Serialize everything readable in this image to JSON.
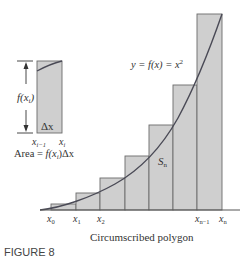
{
  "figure": {
    "label": "FIGURE 8",
    "caption": "Circumscribed polygon",
    "curve_label": "y = f(x) = x",
    "curve_label_exp": "2",
    "region_label": "S",
    "region_label_sub": "n",
    "x_labels": [
      {
        "base": "x",
        "sub": "0"
      },
      {
        "base": "x",
        "sub": "1"
      },
      {
        "base": "x",
        "sub": "2"
      },
      {
        "base": "x",
        "sub": "n−1"
      },
      {
        "base": "x",
        "sub": "n"
      }
    ]
  },
  "inset": {
    "height_label": "f(x",
    "height_label_sub": "i",
    "height_label_close": ")",
    "width_label": "Δx",
    "left_label": {
      "base": "x",
      "sub": "i−1"
    },
    "right_label": {
      "base": "x",
      "sub": "i"
    },
    "area_formula_prefix": "Area = ",
    "area_formula_f": "f(x",
    "area_formula_sub": "i",
    "area_formula_suffix": ")Δx"
  },
  "colors": {
    "bar_fill": "#cfcfcf",
    "bar_stroke": "#6a6a6a",
    "curve": "#4a4a56"
  }
}
